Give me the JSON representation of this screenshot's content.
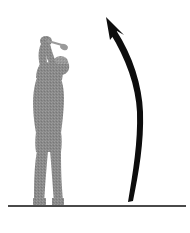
{
  "image": {
    "title": "Golf swing follow-through with upward curved arrow",
    "width": 190,
    "height": 233,
    "background_color": "#ffffff"
  },
  "figure": {
    "name": "golfer-silhouette",
    "fill_color": "#8a8a8a",
    "texture": "dithered halftone",
    "bounds": {
      "x": 23,
      "y": 36,
      "width": 48,
      "height": 170
    }
  },
  "club": {
    "name": "golf-club",
    "description": "Club shaft angled up-right with club head",
    "color": "#9a9a9a"
  },
  "arrow": {
    "name": "upward-curved-arrow",
    "description": "Thick black arrow curving from lower right up to upper left",
    "color": "#0d0d0d",
    "start": {
      "x": 134,
      "y": 201
    },
    "end": {
      "x": 107,
      "y": 18
    }
  },
  "ground": {
    "name": "ground-line",
    "description": "Horizontal ground reference line",
    "color": "#4a4a4a",
    "y": 206,
    "x_start": 8,
    "x_end": 186,
    "thickness": 2
  }
}
